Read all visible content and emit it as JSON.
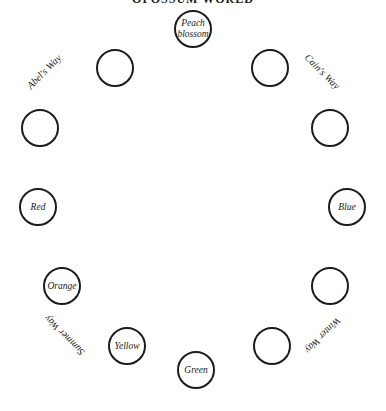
{
  "title": "OPOSSUM WORLD",
  "circles": [
    {
      "label": "Peach blossom",
      "line1": "Peach",
      "line2": "blossom"
    },
    {
      "label": ""
    },
    {
      "label": ""
    },
    {
      "label": ""
    },
    {
      "label": ""
    },
    {
      "label": "Red"
    },
    {
      "label": "Blue"
    },
    {
      "label": "Orange"
    },
    {
      "label": ""
    },
    {
      "label": "Yellow"
    },
    {
      "label": ""
    },
    {
      "label": "Green"
    }
  ],
  "ways": {
    "abel": "Abel's Way",
    "cain": "Cain's Way",
    "summer": "Summer Way",
    "winter": "Winter Way"
  }
}
